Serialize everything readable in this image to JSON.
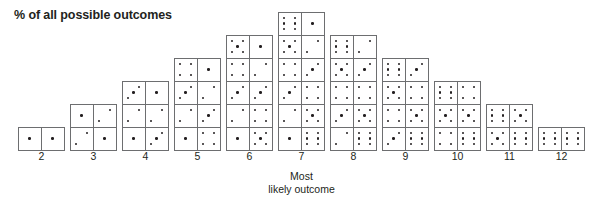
{
  "chart_data": {
    "type": "bar",
    "title": "% of all possible outcomes",
    "xlabel": "",
    "ylabel": "",
    "categories": [
      "2",
      "3",
      "4",
      "5",
      "6",
      "7",
      "8",
      "9",
      "10",
      "11",
      "12"
    ],
    "values": [
      1,
      2,
      3,
      4,
      5,
      6,
      5,
      4,
      3,
      2,
      1
    ],
    "total_outcomes": 36,
    "grid": false,
    "legend": null,
    "unit": "number of dice-pair combinations",
    "annotations": [
      {
        "text": "Most likely outcome",
        "target_category": "7"
      }
    ],
    "columns": [
      {
        "sum": "2",
        "count": 1,
        "pairs": [
          [
            1,
            1
          ]
        ]
      },
      {
        "sum": "3",
        "count": 2,
        "pairs": [
          [
            1,
            2
          ],
          [
            2,
            1
          ]
        ]
      },
      {
        "sum": "4",
        "count": 3,
        "pairs": [
          [
            3,
            1
          ],
          [
            2,
            2
          ],
          [
            1,
            3
          ]
        ]
      },
      {
        "sum": "5",
        "count": 4,
        "pairs": [
          [
            4,
            1
          ],
          [
            3,
            2
          ],
          [
            2,
            3
          ],
          [
            1,
            4
          ]
        ]
      },
      {
        "sum": "6",
        "count": 5,
        "pairs": [
          [
            5,
            1
          ],
          [
            4,
            2
          ],
          [
            3,
            3
          ],
          [
            2,
            4
          ],
          [
            1,
            5
          ]
        ]
      },
      {
        "sum": "7",
        "count": 6,
        "pairs": [
          [
            6,
            1
          ],
          [
            5,
            2
          ],
          [
            4,
            3
          ],
          [
            3,
            4
          ],
          [
            2,
            5
          ],
          [
            1,
            6
          ]
        ]
      },
      {
        "sum": "8",
        "count": 5,
        "pairs": [
          [
            6,
            2
          ],
          [
            5,
            3
          ],
          [
            4,
            4
          ],
          [
            3,
            5
          ],
          [
            2,
            6
          ]
        ]
      },
      {
        "sum": "9",
        "count": 4,
        "pairs": [
          [
            6,
            3
          ],
          [
            5,
            4
          ],
          [
            4,
            5
          ],
          [
            3,
            6
          ]
        ]
      },
      {
        "sum": "10",
        "count": 3,
        "pairs": [
          [
            6,
            4
          ],
          [
            5,
            5
          ],
          [
            4,
            6
          ]
        ]
      },
      {
        "sum": "11",
        "count": 2,
        "pairs": [
          [
            6,
            5
          ],
          [
            5,
            6
          ]
        ]
      },
      {
        "sum": "12",
        "count": 1,
        "pairs": [
          [
            6,
            6
          ]
        ]
      }
    ]
  },
  "title": "% of all possible outcomes",
  "callout": {
    "line1": "Most",
    "line2": "likely outcome"
  },
  "colors": {
    "ink": "#231f20",
    "die_border": "#6d6e70",
    "die_face": "#ffffff",
    "background": "#ffffff"
  },
  "layout": {
    "column_left_positions": [
      18,
      70,
      122,
      174,
      226,
      278,
      330,
      382,
      434,
      486,
      538
    ],
    "column_width": 47,
    "die_size": 24
  }
}
